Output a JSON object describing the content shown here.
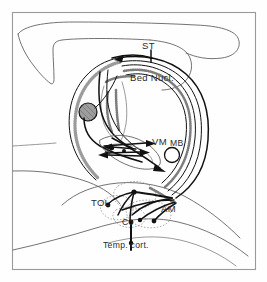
{
  "figure": {
    "type": "anatomical-line-diagram",
    "background_color": "#fefefe",
    "ink_color": "#111111",
    "frame_color": "#9a9a9a"
  },
  "labels": {
    "st": "ST",
    "bed_nucl": "Bed Nucl.",
    "vm": "VM",
    "mb": "MB",
    "a": "A",
    "tol": "TOL",
    "co": "Co",
    "am": "AM",
    "temp_cort": "Temp. cort."
  },
  "structures": [
    {
      "name": "stria-terminalis",
      "abbrev": "ST",
      "kind": "fiber-bundle"
    },
    {
      "name": "bed-nucleus-of-stria-terminalis",
      "abbrev": "Bed Nucl.",
      "kind": "nucleus"
    },
    {
      "name": "ventromedial-nucleus",
      "abbrev": "VM",
      "kind": "nucleus"
    },
    {
      "name": "mammillary-body",
      "abbrev": "MB",
      "kind": "nucleus"
    },
    {
      "name": "anterior-nucleus",
      "abbrev": "A",
      "kind": "nucleus"
    },
    {
      "name": "tuberculum-olfactorium",
      "abbrev": "TOL",
      "kind": "nucleus"
    },
    {
      "name": "cortical-nucleus",
      "abbrev": "Co",
      "kind": "nucleus"
    },
    {
      "name": "amygdala",
      "abbrev": "AM",
      "kind": "nucleus"
    },
    {
      "name": "temporal-cortex",
      "abbrev": "Temp. cort.",
      "kind": "cortex"
    }
  ]
}
